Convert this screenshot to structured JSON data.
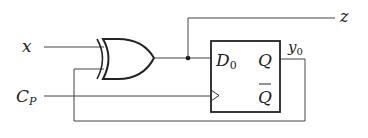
{
  "diagram": {
    "type": "sequential-circuit",
    "inputs": {
      "x": "x",
      "clock": "C",
      "clock_sub": "P"
    },
    "outputs": {
      "z": "z",
      "y": "y",
      "y_sub": "0"
    },
    "gate": {
      "kind": "XOR"
    },
    "flipflop": {
      "kind": "D flip-flop",
      "d_label": "D",
      "d_sub": "0",
      "q_label": "Q",
      "qbar_label": "Q"
    },
    "colors": {
      "line": "#333333",
      "gate": "#222222"
    }
  }
}
